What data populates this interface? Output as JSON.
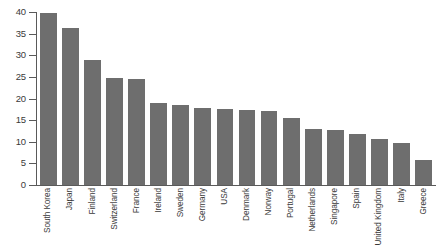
{
  "chart_data": {
    "type": "bar",
    "title": "",
    "subtitle": "",
    "xlabel": "",
    "ylabel": "",
    "ylim": [
      0,
      40
    ],
    "yticks": [
      0,
      5,
      10,
      15,
      20,
      25,
      30,
      35,
      40
    ],
    "ytick_labels": [
      "0",
      "5",
      "10",
      "15",
      "20",
      "25",
      "30",
      "35",
      "40"
    ],
    "grid": false,
    "legend": null,
    "bar_color": "#6e6e6e",
    "axis_color": "#5a5a5a",
    "background_color": "#ffffff",
    "categories": [
      "South Korea",
      "Japan",
      "Finland",
      "Switzerland",
      "France",
      "Ireland",
      "Sweden",
      "Germany",
      "USA",
      "Denmark",
      "Norway",
      "Portugal",
      "Netherlands",
      "Singapore",
      "Spain",
      "United Kingdom",
      "Italy",
      "Greece"
    ],
    "values": [
      39.8,
      36.2,
      28.9,
      24.8,
      24.6,
      19.0,
      18.4,
      17.8,
      17.5,
      17.3,
      17.1,
      15.5,
      13.0,
      12.8,
      11.8,
      10.7,
      9.8,
      5.7
    ]
  }
}
